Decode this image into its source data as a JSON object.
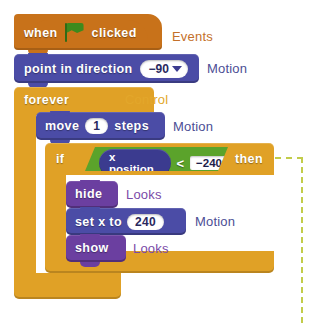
{
  "script": {
    "title": "Scratch block script",
    "hat": {
      "name": "when-green-flag-clicked",
      "word_when": "when",
      "word_clicked": "clicked",
      "icon": "green-flag-icon",
      "category": "Events",
      "color": "#C8721A"
    },
    "blocks": [
      {
        "id": "point-in-direction",
        "label": "point in direction",
        "value": "−90",
        "input_type": "dropdown",
        "category": "Motion",
        "color": "#4B4CA6"
      },
      {
        "id": "forever",
        "label": "forever",
        "category": "Control",
        "color": "#E0A126",
        "loop_icon": "loop-arrow-icon"
      },
      {
        "id": "move-steps",
        "label_before": "move",
        "value": "1",
        "label_after": "steps",
        "category": "Motion",
        "color": "#4B4CA6"
      },
      {
        "id": "if-then",
        "word_if": "if",
        "word_then": "then",
        "category": "Control",
        "color": "#E0A126",
        "condition": {
          "operator": "<",
          "left_reporter": "x position",
          "right_value": "−240",
          "color": "#5BA32B",
          "reporter_color": "#3B3B8F"
        }
      },
      {
        "id": "hide",
        "label": "hide",
        "category": "Looks",
        "color": "#6B3FA0"
      },
      {
        "id": "set-x-to",
        "label_before": "set x to",
        "value": "240",
        "category": "Motion",
        "color": "#4B4CA6"
      },
      {
        "id": "show",
        "label": "show",
        "category": "Looks",
        "color": "#6B3FA0"
      }
    ],
    "category_labels": {
      "events": "Events",
      "motion_1": "Motion",
      "control": "Control",
      "motion_2": "Motion",
      "looks_1": "Looks",
      "motion_3": "Motion",
      "looks_2": "Looks"
    },
    "category_colors": {
      "events": "#C4702A",
      "motion": "#4C4E95",
      "control": "#E3A72B",
      "looks": "#7A4AA8"
    },
    "annotation": {
      "name": "if-branch-callout",
      "style": "dashed",
      "color": "#C2CC4A"
    }
  }
}
